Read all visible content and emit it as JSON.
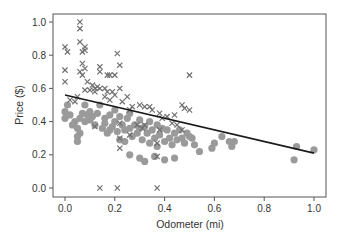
{
  "chart_data": {
    "type": "scatter",
    "title": "",
    "xlabel": "Odometer (mi)",
    "ylabel": "Price ($)",
    "xlim": [
      -0.05,
      1.05
    ],
    "ylim": [
      -0.05,
      1.04
    ],
    "xticks": [
      0.0,
      0.2,
      0.4,
      0.6,
      0.8,
      1.0
    ],
    "xtick_labels": [
      "0.0",
      "0.2",
      "0.4",
      "0.6",
      "0.8",
      "1.0"
    ],
    "yticks": [
      0.0,
      0.2,
      0.4,
      0.6,
      0.8,
      1.0
    ],
    "ytick_labels": [
      "0.0",
      "0.2",
      "0.4",
      "0.6",
      "0.8",
      "1.0"
    ],
    "grid": false,
    "legend": null,
    "colors": {
      "circle": "#9a9a9a",
      "cross": "#707070",
      "line": "#1a1a1a",
      "axis": "#555555"
    },
    "series": [
      {
        "name": "circle",
        "marker": "o",
        "points": [
          [
            0.0,
            0.42
          ],
          [
            0.0,
            0.46
          ],
          [
            0.01,
            0.5
          ],
          [
            0.02,
            0.44
          ],
          [
            0.03,
            0.38
          ],
          [
            0.04,
            0.4
          ],
          [
            0.05,
            0.36
          ],
          [
            0.05,
            0.31
          ],
          [
            0.05,
            0.28
          ],
          [
            0.06,
            0.33
          ],
          [
            0.06,
            0.42
          ],
          [
            0.07,
            0.45
          ],
          [
            0.08,
            0.5
          ],
          [
            0.08,
            0.4
          ],
          [
            0.09,
            0.44
          ],
          [
            0.1,
            0.46
          ],
          [
            0.1,
            0.41
          ],
          [
            0.11,
            0.43
          ],
          [
            0.12,
            0.38
          ],
          [
            0.13,
            0.45
          ],
          [
            0.14,
            0.5
          ],
          [
            0.15,
            0.36
          ],
          [
            0.16,
            0.42
          ],
          [
            0.17,
            0.33
          ],
          [
            0.18,
            0.44
          ],
          [
            0.19,
            0.37
          ],
          [
            0.2,
            0.4
          ],
          [
            0.2,
            0.47
          ],
          [
            0.21,
            0.34
          ],
          [
            0.22,
            0.43
          ],
          [
            0.22,
            0.29
          ],
          [
            0.23,
            0.38
          ],
          [
            0.24,
            0.35
          ],
          [
            0.25,
            0.42
          ],
          [
            0.26,
            0.36
          ],
          [
            0.26,
            0.45
          ],
          [
            0.27,
            0.31
          ],
          [
            0.28,
            0.38
          ],
          [
            0.29,
            0.33
          ],
          [
            0.3,
            0.41
          ],
          [
            0.3,
            0.36
          ],
          [
            0.31,
            0.29
          ],
          [
            0.32,
            0.37
          ],
          [
            0.33,
            0.33
          ],
          [
            0.34,
            0.4
          ],
          [
            0.34,
            0.27
          ],
          [
            0.35,
            0.35
          ],
          [
            0.36,
            0.3
          ],
          [
            0.37,
            0.38
          ],
          [
            0.37,
            0.25
          ],
          [
            0.38,
            0.32
          ],
          [
            0.39,
            0.36
          ],
          [
            0.4,
            0.28
          ],
          [
            0.41,
            0.35
          ],
          [
            0.42,
            0.3
          ],
          [
            0.43,
            0.26
          ],
          [
            0.44,
            0.33
          ],
          [
            0.45,
            0.29
          ],
          [
            0.46,
            0.35
          ],
          [
            0.47,
            0.3
          ],
          [
            0.48,
            0.27
          ],
          [
            0.49,
            0.33
          ],
          [
            0.5,
            0.31
          ],
          [
            0.51,
            0.3
          ],
          [
            0.52,
            0.26
          ],
          [
            0.54,
            0.22
          ],
          [
            0.59,
            0.24
          ],
          [
            0.6,
            0.27
          ],
          [
            0.63,
            0.31
          ],
          [
            0.66,
            0.28
          ],
          [
            0.67,
            0.25
          ],
          [
            0.68,
            0.28
          ],
          [
            0.92,
            0.17
          ],
          [
            0.93,
            0.25
          ],
          [
            1.0,
            0.23
          ],
          [
            0.36,
            0.19
          ],
          [
            0.3,
            0.18
          ],
          [
            0.32,
            0.16
          ],
          [
            0.26,
            0.2
          ],
          [
            0.4,
            0.17
          ],
          [
            0.44,
            0.18
          ],
          [
            0.16,
            0.39
          ],
          [
            0.18,
            0.35
          ],
          [
            0.24,
            0.28
          ]
        ]
      },
      {
        "name": "cross",
        "marker": "x",
        "points": [
          [
            0.06,
            1.0
          ],
          [
            0.06,
            0.96
          ],
          [
            0.06,
            0.88
          ],
          [
            0.0,
            0.85
          ],
          [
            0.01,
            0.82
          ],
          [
            0.08,
            0.85
          ],
          [
            0.07,
            0.82
          ],
          [
            0.08,
            0.83
          ],
          [
            0.21,
            0.81
          ],
          [
            0.22,
            0.74
          ],
          [
            0.07,
            0.75
          ],
          [
            0.08,
            0.72
          ],
          [
            0.06,
            0.7
          ],
          [
            0.07,
            0.68
          ],
          [
            0.14,
            0.73
          ],
          [
            0.14,
            0.7
          ],
          [
            0.17,
            0.68
          ],
          [
            0.18,
            0.68
          ],
          [
            0.2,
            0.68
          ],
          [
            0.0,
            0.71
          ],
          [
            0.0,
            0.64
          ],
          [
            0.09,
            0.64
          ],
          [
            0.11,
            0.62
          ],
          [
            0.12,
            0.6
          ],
          [
            0.13,
            0.61
          ],
          [
            0.14,
            0.6
          ],
          [
            0.16,
            0.6
          ],
          [
            0.17,
            0.58
          ],
          [
            0.08,
            0.59
          ],
          [
            0.1,
            0.59
          ],
          [
            0.12,
            0.58
          ],
          [
            0.19,
            0.58
          ],
          [
            0.2,
            0.56
          ],
          [
            0.22,
            0.6
          ],
          [
            0.25,
            0.55
          ],
          [
            0.16,
            0.55
          ],
          [
            0.18,
            0.53
          ],
          [
            0.23,
            0.52
          ],
          [
            0.26,
            0.47
          ],
          [
            0.27,
            0.49
          ],
          [
            0.3,
            0.5
          ],
          [
            0.32,
            0.49
          ],
          [
            0.34,
            0.49
          ],
          [
            0.35,
            0.47
          ],
          [
            0.38,
            0.45
          ],
          [
            0.39,
            0.42
          ],
          [
            0.41,
            0.43
          ],
          [
            0.44,
            0.44
          ],
          [
            0.47,
            0.5
          ],
          [
            0.48,
            0.48
          ],
          [
            0.5,
            0.47
          ],
          [
            0.5,
            0.68
          ],
          [
            0.43,
            0.39
          ],
          [
            0.45,
            0.38
          ],
          [
            0.47,
            0.35
          ],
          [
            0.12,
            0.37
          ],
          [
            0.22,
            0.39
          ],
          [
            0.22,
            0.3
          ],
          [
            0.22,
            0.24
          ],
          [
            0.26,
            0.32
          ],
          [
            0.29,
            0.38
          ],
          [
            0.31,
            0.36
          ],
          [
            0.32,
            0.38
          ],
          [
            0.37,
            0.27
          ],
          [
            0.38,
            0.35
          ],
          [
            0.37,
            0.19
          ],
          [
            0.14,
            0.0
          ],
          [
            0.21,
            0.0
          ],
          [
            0.37,
            0.0
          ],
          [
            0.05,
            0.55
          ],
          [
            0.02,
            0.53
          ],
          [
            0.04,
            0.52
          ]
        ]
      }
    ],
    "trend_line": {
      "x": [
        0.0,
        1.0
      ],
      "y": [
        0.56,
        0.21
      ]
    }
  }
}
